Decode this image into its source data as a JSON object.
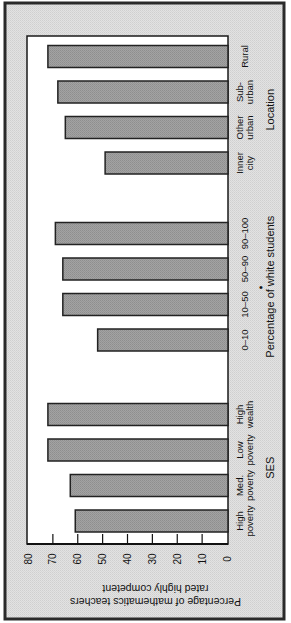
{
  "chart_data": {
    "type": "bar",
    "orientation": "rotated-90-ccw",
    "title": "",
    "ylabel": [
      "Percentage of mathematics teachers",
      "rated highly competent"
    ],
    "ylim": [
      0,
      80
    ],
    "yticks": [
      "0",
      "10",
      "20",
      "30",
      "40",
      "50",
      "60",
      "70",
      "80"
    ],
    "grid": false,
    "groups": [
      {
        "name": "SES",
        "categories": [
          [
            "High",
            "poverty"
          ],
          [
            "Med.",
            "poverty"
          ],
          [
            "Low",
            "poverty"
          ],
          [
            "High",
            "wealth"
          ]
        ],
        "values": [
          61,
          63,
          72,
          72
        ]
      },
      {
        "name": "Percentage of white students",
        "marker": "•",
        "categories": [
          [
            "0–10"
          ],
          [
            "10–50"
          ],
          [
            "50–90"
          ],
          [
            "90–100"
          ]
        ],
        "values": [
          52,
          66,
          66,
          69
        ]
      },
      {
        "name": "Location",
        "categories": [
          [
            "Inner",
            "city"
          ],
          [
            "Other",
            "urban"
          ],
          [
            "Sub-",
            "urban"
          ],
          [
            "Rural"
          ]
        ],
        "values": [
          49,
          65,
          68,
          72
        ]
      }
    ],
    "colors": {
      "frame_bg": "#dcdcdc",
      "frame_border": "#2a2a2a",
      "plot_bg": "#ffffff",
      "bar_fill": "#9c9c9c",
      "bar_stroke": "#222222"
    }
  }
}
